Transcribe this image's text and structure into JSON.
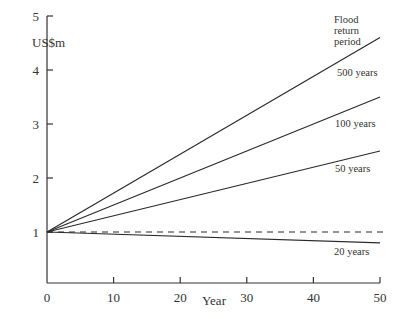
{
  "chart_data": {
    "type": "line",
    "title": "",
    "xlabel": "Year",
    "ylabel": "US$m",
    "xlim": [
      0,
      50
    ],
    "ylim": [
      0,
      5
    ],
    "x_ticks": [
      "0",
      "10",
      "20",
      "30",
      "40",
      "50"
    ],
    "y_ticks": [
      "1",
      "2",
      "3",
      "4",
      "5"
    ],
    "grid": false,
    "legend_title": "Flood return period",
    "legend_title_lines": [
      "Flood",
      "return",
      "period"
    ],
    "x": [
      0,
      50
    ],
    "series": [
      {
        "name": "500 years",
        "values": [
          1.0,
          4.6
        ],
        "style": "solid"
      },
      {
        "name": "100 years",
        "values": [
          1.0,
          3.5
        ],
        "style": "solid"
      },
      {
        "name": "50 years",
        "values": [
          1.0,
          2.5
        ],
        "style": "solid"
      },
      {
        "name": "baseline",
        "values": [
          1.0,
          1.0
        ],
        "style": "dashed"
      },
      {
        "name": "20 years",
        "values": [
          1.0,
          0.8
        ],
        "style": "solid"
      }
    ]
  }
}
